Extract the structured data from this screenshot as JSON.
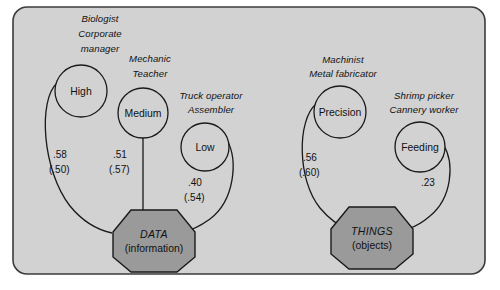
{
  "figure": {
    "panel_fill": "#d2d2d2",
    "panel_stroke": "#3c3c3c",
    "circle_fill": "#d2d2d2",
    "circle_stroke": "#1a1a1a",
    "octagon_fill": "#9a9a9a",
    "octagon_stroke": "#1a1a1a",
    "edge_stroke": "#1a1a1a",
    "text_color": "#111111"
  },
  "constructs": [
    {
      "id": "data",
      "title": "DATA",
      "subtitle": "(information)"
    },
    {
      "id": "things",
      "title": "THINGS",
      "subtitle": "(objects)"
    }
  ],
  "nodes": [
    {
      "id": "high",
      "label": "High",
      "occupations": [
        "Biologist",
        "Corporate",
        "manager"
      ],
      "construct": "DATA",
      "coefficient": ".58",
      "coefficient_alt": "(.50)"
    },
    {
      "id": "medium",
      "label": "Medium",
      "occupations": [
        "Mechanic",
        "Teacher"
      ],
      "construct": "DATA",
      "coefficient": ".51",
      "coefficient_alt": "(.57)"
    },
    {
      "id": "low",
      "label": "Low",
      "occupations": [
        "Truck operator",
        "Assembler"
      ],
      "construct": "DATA",
      "coefficient": ".40",
      "coefficient_alt": "(.54)"
    },
    {
      "id": "precision",
      "label": "Precision",
      "occupations": [
        "Machinist",
        "Metal fabricator"
      ],
      "construct": "THINGS",
      "coefficient": ".56",
      "coefficient_alt": "(.60)"
    },
    {
      "id": "feeding",
      "label": "Feeding",
      "occupations": [
        "Shrimp picker",
        "Cannery worker"
      ],
      "construct": "THINGS",
      "coefficient": ".23",
      "coefficient_alt": ""
    }
  ]
}
